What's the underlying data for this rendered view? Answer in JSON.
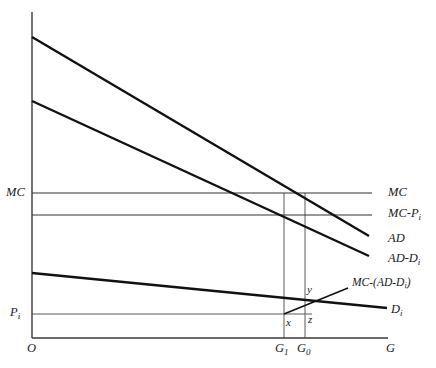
{
  "figure": {
    "type": "economics-line-diagram",
    "background_color": "#ffffff",
    "line_color": "#1a1a1a",
    "thin_line_color": "#555555"
  },
  "axes": {
    "origin_label": "O",
    "x_axis_label": "G",
    "y_axis_label": "",
    "x_ticks": [
      {
        "id": "G1",
        "label": "G",
        "subscript": "1",
        "x": 284
      },
      {
        "id": "G0",
        "label": "G",
        "subscript": "0",
        "x": 305
      }
    ],
    "y_ticks": [
      {
        "id": "MC",
        "label": "MC",
        "subscript": "",
        "y": 193
      },
      {
        "id": "Pi",
        "label": "P",
        "subscript": "i",
        "y": 314
      }
    ]
  },
  "curves": [
    {
      "id": "AD",
      "label": "AD",
      "subscript": "",
      "kind": "downward-sloping",
      "start": {
        "x": 32,
        "y": 37
      },
      "end": {
        "x": 369,
        "y": 236
      }
    },
    {
      "id": "AD-Di",
      "label": "AD-D",
      "subscript": "i",
      "kind": "downward-sloping",
      "start": {
        "x": 32,
        "y": 101
      },
      "end": {
        "x": 369,
        "y": 256
      }
    },
    {
      "id": "Di",
      "label": "D",
      "subscript": "i",
      "kind": "downward-sloping-shallow",
      "start": {
        "x": 32,
        "y": 273
      },
      "end": {
        "x": 387,
        "y": 308
      }
    },
    {
      "id": "MC",
      "label": "MC",
      "subscript": "",
      "kind": "horizontal",
      "start": {
        "x": 32,
        "y": 193
      },
      "end": {
        "x": 372,
        "y": 193
      }
    },
    {
      "id": "MC-Pi",
      "label": "MC-P",
      "subscript": "i",
      "kind": "horizontal",
      "start": {
        "x": 32,
        "y": 215
      },
      "end": {
        "x": 372,
        "y": 215
      }
    },
    {
      "id": "MC-(AD-Di)",
      "label": "MC-(AD-D",
      "subscript": "i",
      "label_tail": ")",
      "kind": "upward-sloping-segment",
      "start": {
        "x": 284,
        "y": 314
      },
      "end": {
        "x": 348,
        "y": 288
      }
    }
  ],
  "guide_lines": [
    {
      "id": "Pi-horizontal",
      "from": {
        "x": 32,
        "y": 314
      },
      "to": {
        "x": 312,
        "y": 314
      }
    },
    {
      "id": "G1-vertical",
      "from": {
        "x": 284,
        "y": 193
      },
      "to": {
        "x": 284,
        "y": 338
      }
    },
    {
      "id": "G0-vertical",
      "from": {
        "x": 305,
        "y": 193
      },
      "to": {
        "x": 305,
        "y": 338
      }
    }
  ],
  "point_labels": [
    {
      "id": "x",
      "text": "x",
      "x": 286,
      "y": 318
    },
    {
      "id": "y",
      "text": "y",
      "x": 308,
      "y": 285
    },
    {
      "id": "z",
      "text": "z",
      "x": 309,
      "y": 315
    }
  ],
  "right_labels": [
    {
      "id": "MC",
      "text": "MC",
      "subscript": "",
      "x": 388,
      "y": 186
    },
    {
      "id": "MC-Pi",
      "text": "MC-P",
      "subscript": "i",
      "x": 388,
      "y": 207
    },
    {
      "id": "AD",
      "text": "AD",
      "subscript": "",
      "x": 388,
      "y": 233
    },
    {
      "id": "AD-Di",
      "text": "AD-D",
      "subscript": "i",
      "x": 388,
      "y": 253
    },
    {
      "id": "MC-(AD-Di)",
      "text": "MC-(AD-D",
      "subscript": "i",
      "tail": ")",
      "x": 352,
      "y": 278
    },
    {
      "id": "Di",
      "text": "D",
      "subscript": "i",
      "x": 392,
      "y": 304
    }
  ],
  "left_labels": [
    {
      "id": "MC",
      "text": "MC",
      "subscript": "",
      "x": 6,
      "y": 186
    },
    {
      "id": "Pi",
      "text": "P",
      "subscript": "i",
      "x": 10,
      "y": 307
    }
  ],
  "bottom_labels": [
    {
      "id": "O",
      "text": "O",
      "subscript": "",
      "x": 27,
      "y": 343
    },
    {
      "id": "G1",
      "text": "G",
      "subscript": "1",
      "x": 276,
      "y": 343
    },
    {
      "id": "G0",
      "text": "G",
      "subscript": "0",
      "x": 298,
      "y": 343
    },
    {
      "id": "G",
      "text": "G",
      "subscript": "",
      "x": 387,
      "y": 343
    }
  ]
}
